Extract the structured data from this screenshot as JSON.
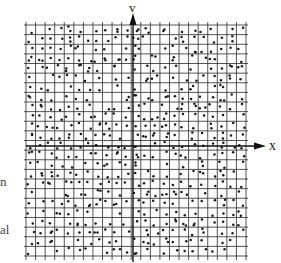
{
  "figure": {
    "axes": {
      "horizontal_label": "x",
      "vertical_label": "v"
    },
    "grid": {
      "left": 26,
      "top": 25,
      "right": 246,
      "bottom": 256,
      "spacing": 9.6,
      "line_color": "#2a2a2a"
    },
    "points": {
      "count_per_cell": 1,
      "color": "#1a1a1a",
      "description": "phase-space points scattered on a grid"
    },
    "axis_color": "#111111"
  },
  "margin_text": {
    "fragment_1": "n",
    "fragment_2": "al"
  }
}
